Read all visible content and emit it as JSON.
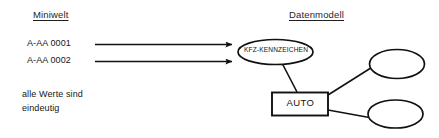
{
  "figure": {
    "type": "entity-relationship-diagram",
    "background_color": "#ffffff",
    "stroke_color": "#111111"
  },
  "headings": {
    "left": "Miniwelt",
    "right": "Datenmodell"
  },
  "miniwelt": {
    "values": [
      "A-AA 0001",
      "A-AA 0002"
    ],
    "note": [
      "alle Werte sind",
      "eindeutig"
    ]
  },
  "datenmodell": {
    "entity": {
      "name": "AUTO",
      "shape": "rectangle"
    },
    "attributes": [
      {
        "name": "KFZ-KENNZEICHEN",
        "shape": "ellipse",
        "label_visible": true
      },
      {
        "name": "",
        "shape": "ellipse",
        "label_visible": false
      },
      {
        "name": "",
        "shape": "ellipse",
        "label_visible": false
      }
    ]
  },
  "arrows": {
    "count": 2,
    "direction": "left-to-right",
    "head": "solid-triangle"
  }
}
